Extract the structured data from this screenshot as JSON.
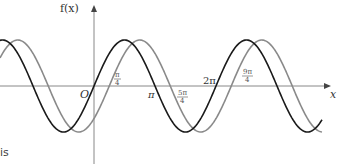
{
  "chart_data": {
    "type": "line",
    "title": "",
    "xlabel": "x",
    "ylabel": "f(x)",
    "origin_label": "O",
    "x_tick_labels": [
      "π/4",
      "π",
      "5π/4",
      "2π",
      "9π/4"
    ],
    "x_tick_values": [
      0.7854,
      3.1416,
      3.927,
      6.2832,
      7.0686
    ],
    "xlim": [
      -4.71,
      7.85
    ],
    "ylim": [
      -1.2,
      1.2
    ],
    "grid": false,
    "legend": null,
    "series": [
      {
        "name": "sin(x)",
        "color": "#1a1a1a",
        "phase_shift": 0,
        "amplitude": 1
      },
      {
        "name": "sin(x - π/4)",
        "color": "#8a8a8a",
        "phase_shift": 0.7854,
        "amplitude": 1
      }
    ]
  },
  "labels": {
    "y_axis": "f(x)",
    "x_axis": "x",
    "origin": "O",
    "pi": "π",
    "two_pi": "2π",
    "frac_pi4": {
      "num": "π",
      "den": "4"
    },
    "frac_5pi4": {
      "num": "5π",
      "den": "4"
    },
    "frac_9pi4": {
      "num": "9π",
      "den": "4"
    }
  },
  "stray_text": "is"
}
